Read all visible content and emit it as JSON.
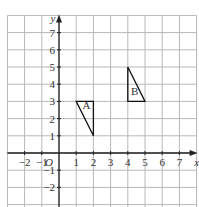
{
  "diagram": {
    "type": "coordinate-grid",
    "x_range": [
      -3,
      8
    ],
    "y_range": [
      -3,
      8
    ],
    "origin_label": "O",
    "x_axis_label": "x",
    "y_axis_label": "y",
    "x_ticks": [
      {
        "v": -2,
        "label": "−2"
      },
      {
        "v": -1,
        "label": "−1"
      },
      {
        "v": 1,
        "label": "1"
      },
      {
        "v": 2,
        "label": "2"
      },
      {
        "v": 3,
        "label": "3"
      },
      {
        "v": 4,
        "label": "4"
      },
      {
        "v": 5,
        "label": "5"
      },
      {
        "v": 6,
        "label": "6"
      },
      {
        "v": 7,
        "label": "7"
      }
    ],
    "y_ticks": [
      {
        "v": 7,
        "label": "7"
      },
      {
        "v": 6,
        "label": "6"
      },
      {
        "v": 5,
        "label": "5"
      },
      {
        "v": 4,
        "label": "4"
      },
      {
        "v": 3,
        "label": "3"
      },
      {
        "v": 2,
        "label": "2"
      },
      {
        "v": 1,
        "label": "1"
      },
      {
        "v": -1,
        "label": "−1"
      },
      {
        "v": -2,
        "label": "−2"
      }
    ],
    "shapes": [
      {
        "label": "A",
        "vertices": [
          [
            1,
            3
          ],
          [
            2,
            3
          ],
          [
            2,
            1
          ]
        ],
        "label_pos": [
          1.6,
          2.55
        ]
      },
      {
        "label": "B",
        "vertices": [
          [
            4,
            5
          ],
          [
            4,
            3
          ],
          [
            5,
            3
          ]
        ],
        "label_pos": [
          4.4,
          3.4
        ]
      }
    ],
    "colors": {
      "grid": "#b8b8b8",
      "axis": "#222222",
      "shape": "#111111"
    }
  }
}
